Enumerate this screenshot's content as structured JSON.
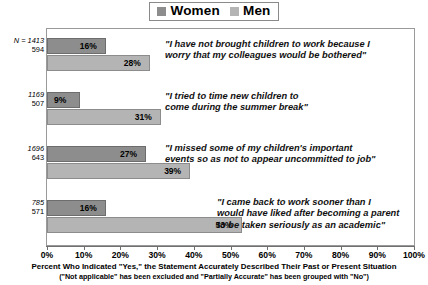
{
  "legend": {
    "items": [
      {
        "label": "Women",
        "color": "#8d8d8d"
      },
      {
        "label": "Men",
        "color": "#b4b4b4"
      }
    ]
  },
  "axis": {
    "ticklabels": [
      "0%",
      "10%",
      "20%",
      "30%",
      "40%",
      "50%",
      "60%",
      "70%",
      "80%",
      "90%",
      "100%"
    ]
  },
  "footer": {
    "line1": "Percent Who Indicated \"Yes,\" the Statement Accurately Described Their Past or Present Situation",
    "line2": "(\"Not applicable\" has been excluded and \"Partially Accurate\" has been grouped with \"No\")"
  },
  "groups": [
    {
      "n_women": "N = 1413",
      "n_men": "594",
      "women_value": 16,
      "men_value": 28,
      "women_label": "16%",
      "men_label": "28%",
      "quote": "\"I have not brought children to work because I\nworry that my colleagues would be bothered\""
    },
    {
      "n_women": "1169",
      "n_men": "507",
      "women_value": 9,
      "men_value": 31,
      "women_label": "9%",
      "men_label": "31%",
      "quote": "\"I tried to time new children to\ncome during the summer break\""
    },
    {
      "n_women": "1696",
      "n_men": "643",
      "women_value": 27,
      "men_value": 39,
      "women_label": "27%",
      "men_label": "39%",
      "quote": "\"I missed some of my children's important\nevents so as not to appear uncommitted to job\""
    },
    {
      "n_women": "785",
      "n_men": "571",
      "women_value": 16,
      "men_value": 53,
      "women_label": "16%",
      "men_label": "53%",
      "quote": "\"I came back to work sooner than I\nwould have liked after becoming a parent\nto be taken seriously as an academic\""
    }
  ],
  "chart_data": {
    "type": "bar",
    "orientation": "horizontal",
    "title": "",
    "xlabel": "Percent Who Indicated \"Yes,\" the Statement Accurately Described Their Past or Present Situation",
    "ylabel": "",
    "xlim": [
      0,
      100
    ],
    "xticks": [
      0,
      10,
      20,
      30,
      40,
      50,
      60,
      70,
      80,
      90,
      100
    ],
    "grid": false,
    "legend_position": "top-center",
    "categories": [
      "\"I have not brought children to work because I worry that my colleagues would be bothered\"",
      "\"I tried to time new children to come during the summer break\"",
      "\"I missed some of my children's important events so as not to appear uncommitted to job\"",
      "\"I came back to work sooner than I would have liked after becoming a parent to be taken seriously as an academic\""
    ],
    "series": [
      {
        "name": "Women",
        "values": [
          16,
          9,
          27,
          16
        ],
        "n": [
          1413,
          1169,
          1696,
          785
        ],
        "color": "#8d8d8d"
      },
      {
        "name": "Men",
        "values": [
          28,
          31,
          39,
          53
        ],
        "n": [
          594,
          507,
          643,
          571
        ],
        "color": "#b4b4b4"
      }
    ],
    "annotations": [
      "(\"Not applicable\" has been excluded and \"Partially Accurate\" has been grouped with \"No\")"
    ]
  }
}
